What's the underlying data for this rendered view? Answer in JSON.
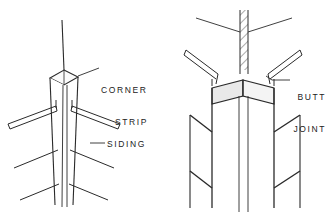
{
  "illustration": {
    "title": "Siding corner treatments",
    "background_color": "#ffffff",
    "line_color": "#1a1a1a",
    "shade_color": "#e8e8e8",
    "figures": [
      {
        "id": "corner-strip-figure",
        "name": "corner-strip",
        "description": "Wood corner strip applied at outside corner with bevel siding butting against it",
        "labels": [
          "CORNER STRIP",
          "SIDING"
        ]
      },
      {
        "id": "butt-joint-figure",
        "name": "butt-joint",
        "description": "Corner boards with siding butt joint against corner post",
        "labels": [
          "BUTT JOINT"
        ]
      }
    ]
  },
  "labels": {
    "corner_strip_line1": "CORNER",
    "corner_strip_line2": "STRIP",
    "siding": "SIDING",
    "butt_joint_line1": "BUTT",
    "butt_joint_line2": "JOINT"
  }
}
